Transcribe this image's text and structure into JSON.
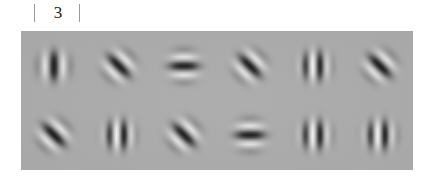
{
  "figure": {
    "page_number": "3",
    "tick_left": "|",
    "tick_right": "|"
  },
  "panel": {
    "background_color": "#a9a9a9",
    "rows": 2,
    "columns": 6
  },
  "chart_data": {
    "type": "heatmap",
    "title": "",
    "xlabel": "",
    "ylabel": "",
    "grid": {
      "rows": 2,
      "columns": 6
    },
    "background_color": "#a9a9a9",
    "patch_parameters": [
      "orientation_deg",
      "spatial_frequency",
      "contrast"
    ],
    "patches": [
      {
        "row": 1,
        "col": 1,
        "orientation_deg": 0,
        "orientation_label": "vertical",
        "spatial_frequency": "medium",
        "bars": 3,
        "contrast": "high"
      },
      {
        "row": 1,
        "col": 2,
        "orientation_deg": -45,
        "orientation_label": "diagonal",
        "spatial_frequency": "medium",
        "bars": 3,
        "contrast": "high"
      },
      {
        "row": 1,
        "col": 3,
        "orientation_deg": 90,
        "orientation_label": "horizontal",
        "spatial_frequency": "medium",
        "bars": 3,
        "contrast": "high"
      },
      {
        "row": 1,
        "col": 4,
        "orientation_deg": -45,
        "orientation_label": "diagonal",
        "spatial_frequency": "medium",
        "bars": 3,
        "contrast": "high"
      },
      {
        "row": 1,
        "col": 5,
        "orientation_deg": 0,
        "orientation_label": "vertical",
        "spatial_frequency": "high",
        "bars": 4,
        "contrast": "high"
      },
      {
        "row": 1,
        "col": 6,
        "orientation_deg": -45,
        "orientation_label": "diagonal",
        "spatial_frequency": "medium",
        "bars": 3,
        "contrast": "high"
      },
      {
        "row": 2,
        "col": 1,
        "orientation_deg": -45,
        "orientation_label": "diagonal",
        "spatial_frequency": "medium",
        "bars": 3,
        "contrast": "high"
      },
      {
        "row": 2,
        "col": 2,
        "orientation_deg": 0,
        "orientation_label": "vertical",
        "spatial_frequency": "high",
        "bars": 5,
        "contrast": "high"
      },
      {
        "row": 2,
        "col": 3,
        "orientation_deg": -45,
        "orientation_label": "diagonal",
        "spatial_frequency": "medium",
        "bars": 3,
        "contrast": "high"
      },
      {
        "row": 2,
        "col": 4,
        "orientation_deg": 90,
        "orientation_label": "horizontal",
        "spatial_frequency": "medium",
        "bars": 3,
        "contrast": "high"
      },
      {
        "row": 2,
        "col": 5,
        "orientation_deg": 0,
        "orientation_label": "vertical",
        "spatial_frequency": "high",
        "bars": 4,
        "contrast": "high"
      },
      {
        "row": 2,
        "col": 6,
        "orientation_deg": 0,
        "orientation_label": "vertical",
        "spatial_frequency": "high",
        "bars": 4,
        "contrast": "high"
      }
    ]
  }
}
